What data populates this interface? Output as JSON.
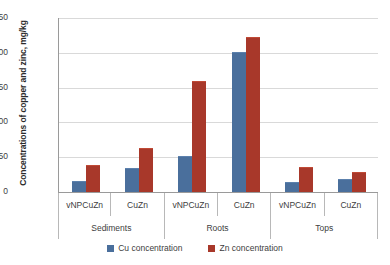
{
  "chart_data": {
    "type": "bar",
    "title": "",
    "xlabel": "",
    "ylabel": "Concentrations of copper and zinc, mg/kg",
    "ylim": [
      0,
      250
    ],
    "yticks": [
      0,
      50,
      100,
      150,
      200,
      250
    ],
    "grid": true,
    "legend_position": "bottom",
    "groups": [
      "Sediments",
      "Roots",
      "Tops"
    ],
    "categories": [
      "vNPCuZn",
      "CuZn",
      "vNPCuZn",
      "CuZn",
      "vNPCuZn",
      "CuZn"
    ],
    "series": [
      {
        "name": "Cu concentration",
        "color": "#4a6f9c",
        "values": [
          15,
          33,
          51,
          200,
          13,
          17
        ]
      },
      {
        "name": "Zn concentration",
        "color": "#a8382a",
        "values": [
          37,
          62,
          158,
          221,
          34,
          28
        ]
      }
    ]
  },
  "legend": {
    "items": [
      {
        "label": "Cu concentration"
      },
      {
        "label": "Zn concentration"
      }
    ]
  }
}
